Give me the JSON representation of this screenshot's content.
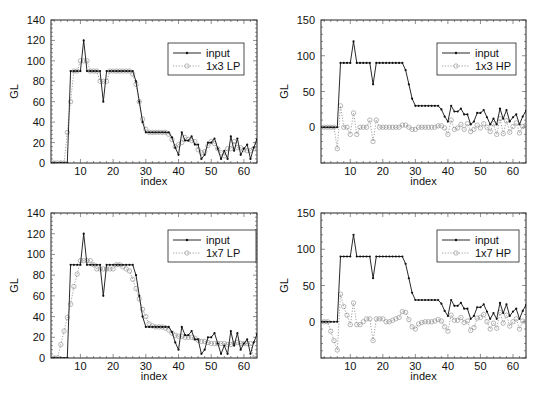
{
  "chart_data": [
    {
      "type": "line",
      "title": "",
      "xlabel": "index",
      "ylabel": "GL",
      "xlim": [
        1,
        64
      ],
      "ylim": [
        0,
        140
      ],
      "xticks": [
        10,
        20,
        30,
        40,
        50,
        60
      ],
      "yticks": [
        0,
        20,
        40,
        60,
        80,
        100,
        120,
        140
      ],
      "legend_position": "top-right",
      "series": [
        {
          "name": "input",
          "style": "solid-dots",
          "values": [
            0,
            0,
            0,
            0,
            0,
            0,
            90,
            90,
            90,
            90,
            120,
            90,
            90,
            90,
            90,
            90,
            60,
            90,
            90,
            90,
            90,
            90,
            90,
            90,
            90,
            90,
            80,
            60,
            40,
            30,
            30,
            30,
            30,
            30,
            30,
            30,
            30,
            25,
            15,
            8,
            30,
            22,
            22,
            26,
            18,
            18,
            4,
            8,
            20,
            20,
            24,
            14,
            4,
            12,
            4,
            26,
            12,
            24,
            8,
            14,
            18,
            4,
            15,
            23,
            23
          ]
        },
        {
          "name": "1x3 LP",
          "style": "dotted-circles",
          "values": [
            0,
            0,
            0,
            0,
            0,
            30,
            60,
            90,
            90,
            100,
            100,
            100,
            90,
            90,
            90,
            80,
            80,
            80,
            90,
            90,
            90,
            90,
            90,
            90,
            90,
            87,
            77,
            60,
            43,
            33,
            30,
            30,
            30,
            30,
            30,
            30,
            28,
            23,
            16,
            18,
            20,
            25,
            23,
            22,
            21,
            13,
            10,
            11,
            17,
            21,
            19,
            14,
            10,
            7,
            14,
            14,
            21,
            15,
            15,
            13,
            12,
            12,
            14,
            20,
            0
          ]
        }
      ]
    },
    {
      "type": "line",
      "title": "",
      "xlabel": "index",
      "ylabel": "GL",
      "xlim": [
        1,
        64
      ],
      "ylim": [
        -50,
        150
      ],
      "xticks": [
        10,
        20,
        30,
        40,
        50,
        60
      ],
      "yticks": [
        0,
        50,
        100,
        150
      ],
      "legend_position": "top-right",
      "series": [
        {
          "name": "input",
          "style": "solid-dots",
          "values": [
            0,
            0,
            0,
            0,
            0,
            0,
            90,
            90,
            90,
            90,
            120,
            90,
            90,
            90,
            90,
            90,
            60,
            90,
            90,
            90,
            90,
            90,
            90,
            90,
            90,
            90,
            80,
            60,
            40,
            30,
            30,
            30,
            30,
            30,
            30,
            30,
            30,
            25,
            15,
            8,
            30,
            22,
            22,
            26,
            18,
            18,
            4,
            8,
            20,
            20,
            24,
            14,
            4,
            12,
            4,
            26,
            12,
            24,
            8,
            14,
            18,
            4,
            15,
            23,
            23
          ]
        },
        {
          "name": "1x3 HP",
          "style": "dotted-circles",
          "values": [
            0,
            0,
            0,
            0,
            0,
            -30,
            30,
            0,
            0,
            -10,
            20,
            -10,
            0,
            0,
            0,
            10,
            -20,
            10,
            0,
            0,
            0,
            0,
            0,
            0,
            0,
            3,
            3,
            0,
            -3,
            -3,
            0,
            0,
            0,
            0,
            0,
            0,
            2,
            2,
            -1,
            -10,
            10,
            -3,
            -1,
            4,
            -3,
            5,
            -6,
            -3,
            3,
            -1,
            5,
            0,
            -6,
            5,
            -10,
            12,
            -9,
            9,
            -7,
            1,
            6,
            -8,
            1,
            3,
            0
          ]
        }
      ]
    },
    {
      "type": "line",
      "title": "",
      "xlabel": "index",
      "ylabel": "GL",
      "xlim": [
        1,
        64
      ],
      "ylim": [
        0,
        140
      ],
      "xticks": [
        10,
        20,
        30,
        40,
        50,
        60
      ],
      "yticks": [
        0,
        20,
        40,
        60,
        80,
        100,
        120,
        140
      ],
      "legend_position": "top-right",
      "series": [
        {
          "name": "input",
          "style": "solid-dots",
          "values": [
            0,
            0,
            0,
            0,
            0,
            0,
            90,
            90,
            90,
            90,
            120,
            90,
            90,
            90,
            90,
            90,
            60,
            90,
            90,
            90,
            90,
            90,
            90,
            90,
            90,
            90,
            80,
            60,
            40,
            30,
            30,
            30,
            30,
            30,
            30,
            30,
            30,
            25,
            15,
            8,
            30,
            22,
            22,
            26,
            18,
            18,
            4,
            8,
            20,
            20,
            24,
            14,
            4,
            12,
            4,
            26,
            12,
            24,
            8,
            14,
            18,
            4,
            15,
            23,
            23
          ]
        },
        {
          "name": "1x7 LP",
          "style": "dotted-circles",
          "values": [
            0,
            0,
            0,
            13,
            26,
            39,
            52,
            69,
            81,
            94,
            94,
            94,
            94,
            90,
            86,
            86,
            86,
            86,
            86,
            86,
            90,
            90,
            88,
            86,
            84,
            76,
            67,
            57,
            47,
            40,
            33,
            31,
            30,
            30,
            30,
            29,
            27,
            24,
            22,
            21,
            21,
            20,
            20,
            20,
            19,
            17,
            16,
            16,
            15,
            14,
            14,
            14,
            14,
            14,
            13,
            13,
            14,
            15,
            14,
            14,
            14,
            14,
            0,
            0,
            0
          ]
        }
      ]
    },
    {
      "type": "line",
      "title": "",
      "xlabel": "index",
      "ylabel": "GL",
      "xlim": [
        1,
        64
      ],
      "ylim": [
        -50,
        150
      ],
      "xticks": [
        10,
        20,
        30,
        40,
        50,
        60
      ],
      "yticks": [
        0,
        50,
        100,
        150
      ],
      "legend_position": "top-right",
      "series": [
        {
          "name": "input",
          "style": "solid-dots",
          "values": [
            0,
            0,
            0,
            0,
            0,
            0,
            90,
            90,
            90,
            90,
            120,
            90,
            90,
            90,
            90,
            90,
            60,
            90,
            90,
            90,
            90,
            90,
            90,
            90,
            90,
            90,
            80,
            60,
            40,
            30,
            30,
            30,
            30,
            30,
            30,
            30,
            30,
            25,
            15,
            8,
            30,
            22,
            22,
            26,
            18,
            18,
            4,
            8,
            20,
            20,
            24,
            14,
            4,
            12,
            4,
            26,
            12,
            24,
            8,
            14,
            18,
            4,
            15,
            23,
            23
          ]
        },
        {
          "name": "1x7 HP",
          "style": "dotted-circles",
          "values": [
            0,
            0,
            0,
            -13,
            -26,
            -39,
            38,
            21,
            9,
            -4,
            26,
            -4,
            -4,
            0,
            4,
            4,
            -26,
            4,
            4,
            4,
            0,
            0,
            2,
            4,
            6,
            14,
            13,
            3,
            -7,
            -10,
            -3,
            -1,
            0,
            0,
            0,
            1,
            3,
            1,
            -7,
            -13,
            9,
            2,
            2,
            6,
            -1,
            1,
            -12,
            -8,
            5,
            6,
            10,
            0,
            -10,
            -2,
            -9,
            13,
            -2,
            9,
            -6,
            0,
            4,
            -10,
            1,
            0,
            0
          ]
        }
      ]
    }
  ]
}
